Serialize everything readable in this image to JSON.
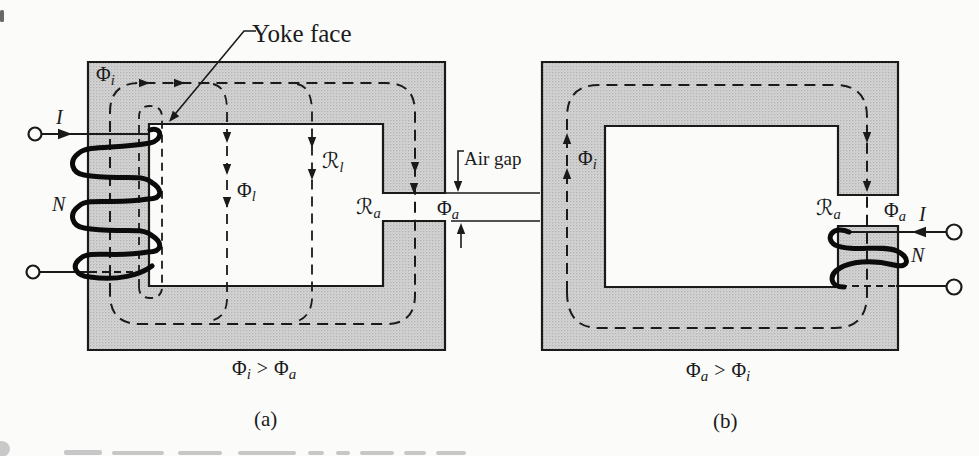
{
  "figure": {
    "type": "magnetic-circuit-diagram",
    "background": "#fbfbfa",
    "colors": {
      "core_fill": "#d6d6d6",
      "core_dot": "#a8a8a8",
      "line": "#1a1a1a"
    },
    "panel_a": {
      "panel_label": "(a)",
      "caption": {
        "lhs_main": "Φ",
        "lhs_sub": "i",
        "op": ">",
        "rhs_main": "Φ",
        "rhs_sub": "a"
      },
      "labels": {
        "yoke_face": "Yoke face",
        "air_gap": "Air gap",
        "current": "I",
        "turns": "N",
        "flux_core_main": "Φ",
        "flux_core_sub": "i",
        "flux_leak_main": "Φ",
        "flux_leak_sub": "l",
        "rel_leak_main": "ℛ",
        "rel_leak_sub": "l",
        "rel_gap_main": "ℛ",
        "rel_gap_sub": "a",
        "flux_gap_main": "Φ",
        "flux_gap_sub": "a"
      }
    },
    "panel_b": {
      "panel_label": "(b)",
      "caption": {
        "lhs_main": "Φ",
        "lhs_sub": "a",
        "op": ">",
        "rhs_main": "Φ",
        "rhs_sub": "i"
      },
      "labels": {
        "current": "I",
        "turns": "N",
        "flux_core_main": "Φ",
        "flux_core_sub": "i",
        "rel_gap_main": "ℛ",
        "rel_gap_sub": "a",
        "flux_gap_main": "Φ",
        "flux_gap_sub": "a"
      }
    }
  }
}
